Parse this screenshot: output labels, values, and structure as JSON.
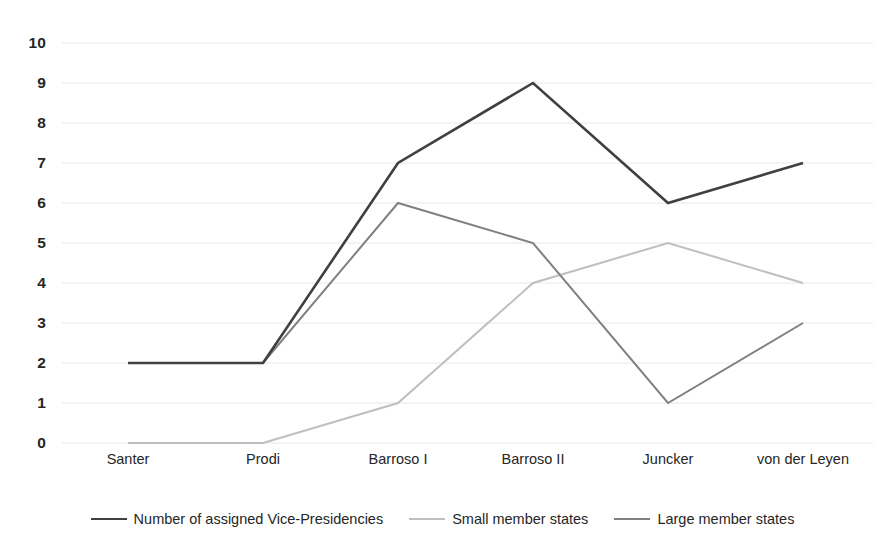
{
  "chart_data": {
    "type": "line",
    "title": "",
    "subtitle": "",
    "xlabel": "",
    "ylabel": "",
    "categories": [
      "Santer",
      "Prodi",
      "Barroso I",
      "Barroso II",
      "Juncker",
      "von der Leyen"
    ],
    "ylim": [
      0,
      10
    ],
    "y_ticks": [
      10,
      9,
      8,
      7,
      6,
      5,
      4,
      3,
      2,
      1,
      0
    ],
    "grid": "horizontal",
    "legend_position": "bottom",
    "series": [
      {
        "name": "Number of assigned Vice-Presidencies",
        "values": [
          2,
          2,
          7,
          9,
          6,
          7
        ],
        "color": "#404040",
        "width": 2.6
      },
      {
        "name": "Small member states",
        "values": [
          0,
          0,
          1,
          4,
          5,
          4
        ],
        "color": "#bfbfbf",
        "width": 2.0
      },
      {
        "name": "Large member states",
        "values": [
          2,
          2,
          6,
          5,
          1,
          3
        ],
        "color": "#808080",
        "width": 2.0
      }
    ]
  },
  "axis": {
    "y_tick_labels": [
      "10",
      "9",
      "8",
      "7",
      "6",
      "5",
      "4",
      "3",
      "2",
      "1",
      "0"
    ],
    "x_tick_labels": [
      "Santer",
      "Prodi",
      "Barroso I",
      "Barroso II",
      "Juncker",
      "von der Leyen"
    ]
  },
  "legend": {
    "items": [
      {
        "label": "Number of assigned Vice-Presidencies",
        "color": "#404040"
      },
      {
        "label": "Small member states",
        "color": "#bfbfbf"
      },
      {
        "label": "Large member states",
        "color": "#808080"
      }
    ]
  },
  "style": {
    "background": "#ffffff",
    "gridline_color": "#e8e8e8",
    "text_color": "#262626"
  }
}
